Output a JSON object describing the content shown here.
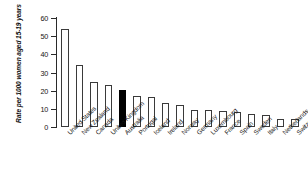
{
  "chart_data": {
    "type": "bar",
    "title": "",
    "subtitle": "",
    "xlabel": "",
    "ylabel": "Rate per 1000 women aged 15-19 years",
    "ylim": [
      0,
      60
    ],
    "ytick_labels": [
      "0",
      "10",
      "20",
      "30",
      "40",
      "50",
      "60"
    ],
    "ytick_values": [
      0,
      10,
      20,
      30,
      40,
      50,
      60
    ],
    "grid": false,
    "legend": "none",
    "highlight_category": "Australia",
    "highlight_color": "#000000",
    "bar_fill_color": "#ffffff",
    "bar_edge_color": "#3a3a3a",
    "categories": [
      "United States",
      "New Zealand",
      "Canada",
      "United Kingdom",
      "Australia",
      "Portugal",
      "Iceland",
      "Ireland",
      "Norway",
      "Germany",
      "Luxembourg",
      "France",
      "Spain",
      "Sweden",
      "Italy",
      "Netherlands",
      "Switzerland"
    ],
    "values": [
      54,
      34,
      25,
      23,
      20.5,
      17,
      16.5,
      13,
      12,
      9.5,
      9.5,
      9,
      8.5,
      7,
      6.5,
      4.5,
      4.5
    ],
    "series": [
      {
        "name": "Rate per 1000 women aged 15-19 years",
        "values": [
          54,
          34,
          25,
          23,
          20.5,
          17,
          16.5,
          13,
          12,
          9.5,
          9.5,
          9,
          8.5,
          7,
          6.5,
          4.5,
          4.5
        ]
      }
    ]
  }
}
